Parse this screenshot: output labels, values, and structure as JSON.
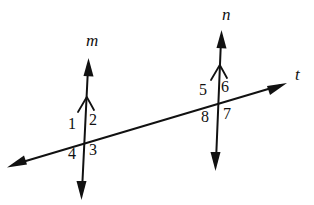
{
  "figure": {
    "background_color": "#ffffff",
    "stroke_color": "#111111",
    "width": 314,
    "height": 205
  },
  "lines": [
    {
      "id": "line-m",
      "label": "m",
      "label_style": "italic",
      "label_x": 86,
      "label_y": 32,
      "x1": 88,
      "y1": 62,
      "x2": 82,
      "y2": 197,
      "arrow_start": true,
      "arrow_end": true,
      "tick_chevron": {
        "x": 86,
        "y": 100,
        "width": 15,
        "height": 12
      }
    },
    {
      "id": "line-n",
      "label": "n",
      "label_style": "italic",
      "label_x": 222,
      "label_y": 6,
      "x1": 221,
      "y1": 33,
      "x2": 216,
      "y2": 168,
      "arrow_start": true,
      "arrow_end": true,
      "tick_chevron": {
        "x": 219,
        "y": 68,
        "width": 15,
        "height": 12
      }
    },
    {
      "id": "line-t",
      "label": "t",
      "label_style": "italic",
      "label_x": 295,
      "label_y": 66,
      "x1": 9,
      "y1": 166,
      "x2": 285,
      "y2": 84,
      "arrow_start": true,
      "arrow_end": true,
      "tick_chevron": null
    }
  ],
  "intersections": [
    {
      "id": "intersection-m-t",
      "x": 85,
      "y": 143
    },
    {
      "id": "intersection-n-t",
      "x": 218,
      "y": 105
    }
  ],
  "angle_labels": [
    {
      "id": "angle-1",
      "text": "1",
      "x": 68,
      "y": 116,
      "at": "intersection-m-t",
      "position": "upper-left"
    },
    {
      "id": "angle-2",
      "text": "2",
      "x": 89,
      "y": 112,
      "at": "intersection-m-t",
      "position": "upper-right"
    },
    {
      "id": "angle-3",
      "text": "3",
      "x": 89,
      "y": 142,
      "at": "intersection-m-t",
      "position": "lower-right"
    },
    {
      "id": "angle-4",
      "text": "4",
      "x": 68,
      "y": 146,
      "at": "intersection-m-t",
      "position": "lower-left"
    },
    {
      "id": "angle-5",
      "text": "5",
      "x": 199,
      "y": 82,
      "at": "intersection-n-t",
      "position": "upper-left"
    },
    {
      "id": "angle-6",
      "text": "6",
      "x": 221,
      "y": 79,
      "at": "intersection-n-t",
      "position": "upper-right"
    },
    {
      "id": "angle-7",
      "text": "7",
      "x": 223,
      "y": 106,
      "at": "intersection-n-t",
      "position": "lower-right"
    },
    {
      "id": "angle-8",
      "text": "8",
      "x": 201,
      "y": 109,
      "at": "intersection-n-t",
      "position": "lower-left"
    }
  ]
}
